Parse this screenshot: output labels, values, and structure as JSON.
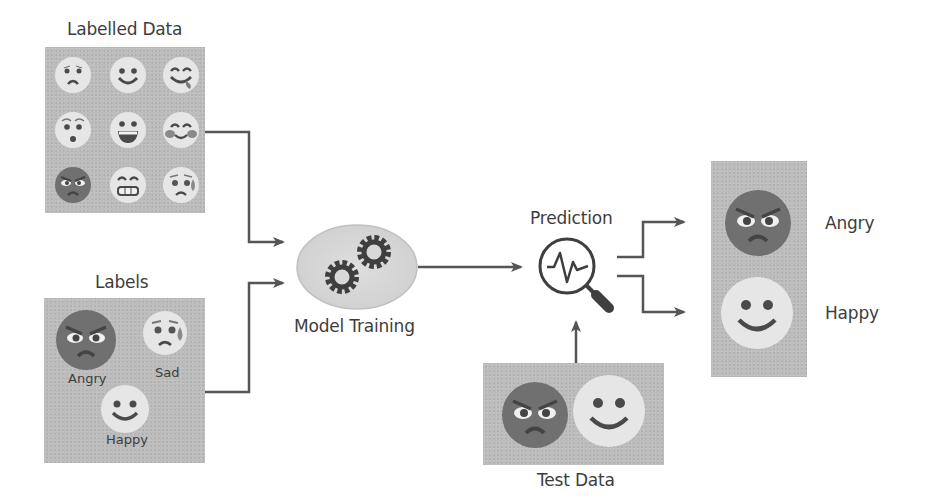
{
  "diagram": {
    "colors": {
      "panel_bg": "#bdbdbd",
      "arrow": "#555555",
      "angry_face": "#6f6f6f",
      "light_face": "#e4e4e4",
      "feature": "#4a4a4a",
      "text": "#3d3d3d"
    },
    "labelled_data": {
      "title": "Labelled Data",
      "emojis": [
        {
          "name": "frowning-face",
          "tone": "light"
        },
        {
          "name": "smiling-face",
          "tone": "light"
        },
        {
          "name": "savoring-face",
          "tone": "light"
        },
        {
          "name": "surprised-face",
          "tone": "light"
        },
        {
          "name": "grinning-face",
          "tone": "light"
        },
        {
          "name": "blushing-smile-face",
          "tone": "light"
        },
        {
          "name": "angry-face",
          "tone": "dark"
        },
        {
          "name": "beaming-grin-face",
          "tone": "light"
        },
        {
          "name": "sad-sweat-face",
          "tone": "light"
        }
      ]
    },
    "labels": {
      "title": "Labels",
      "items": [
        {
          "label": "Angry",
          "emoji": "angry-face"
        },
        {
          "label": "Sad",
          "emoji": "sad-sweat-face"
        },
        {
          "label": "Happy",
          "emoji": "smiling-face"
        }
      ]
    },
    "model_training": {
      "title": "Model Training",
      "icon": "gears-icon"
    },
    "prediction": {
      "title": "Prediction",
      "icon": "magnifier-waveform-icon"
    },
    "test_data": {
      "title": "Test Data",
      "emojis": [
        "angry-face",
        "smiling-face"
      ]
    },
    "output": {
      "items": [
        {
          "label": "Angry",
          "emoji": "angry-face"
        },
        {
          "label": "Happy",
          "emoji": "smiling-face"
        }
      ]
    },
    "edges": [
      {
        "from": "Labelled Data",
        "to": "Model Training"
      },
      {
        "from": "Labels",
        "to": "Model Training"
      },
      {
        "from": "Model Training",
        "to": "Prediction"
      },
      {
        "from": "Test Data",
        "to": "Prediction"
      },
      {
        "from": "Prediction",
        "to": "Angry"
      },
      {
        "from": "Prediction",
        "to": "Happy"
      }
    ]
  }
}
